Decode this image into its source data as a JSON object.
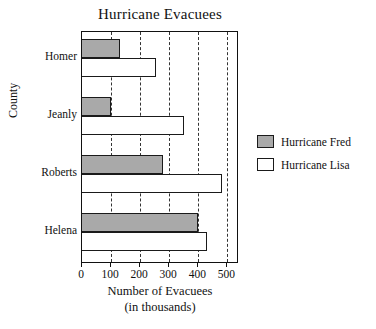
{
  "chart_data": {
    "type": "bar",
    "orientation": "horizontal",
    "title": "Hurricane Evacuees",
    "xlabel": "Number of Evacuees",
    "xlabel_line2": "(in thousands)",
    "ylabel": "County",
    "categories": [
      "Homer",
      "Jeanly",
      "Roberts",
      "Helena"
    ],
    "series": [
      {
        "name": "Hurricane Fred",
        "values": [
          130,
          100,
          280,
          400
        ],
        "color": "#a9a9a9"
      },
      {
        "name": "Hurricane Lisa",
        "values": [
          255,
          350,
          480,
          430
        ],
        "color": "#ffffff"
      }
    ],
    "xlim": [
      0,
      540
    ],
    "xticks": [
      0,
      100,
      200,
      300,
      400,
      500
    ],
    "xtick_labels": [
      "0",
      "100",
      "200",
      "300",
      "400",
      "500"
    ],
    "gridlines": [
      100,
      200,
      300,
      400,
      500
    ],
    "grid": true,
    "grid_style": "dashed",
    "legend_position": "right"
  },
  "legend": {
    "items": [
      {
        "label": "Hurricane Fred",
        "swatch": "fred"
      },
      {
        "label": "Hurricane Lisa",
        "swatch": "lisa"
      }
    ]
  }
}
